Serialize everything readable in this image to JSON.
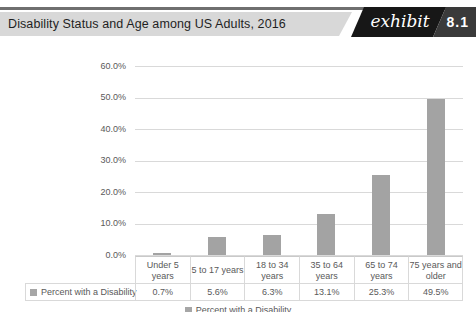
{
  "header": {
    "title": "Disability Status and Age among US Adults, 2016",
    "exhibit_label": "exhibit",
    "exhibit_number": "8.1"
  },
  "chart_data": {
    "type": "bar",
    "title": "Disability Status and Age among US Adults, 2016",
    "categories": [
      "Under 5 years",
      "5 to 17 years",
      "18 to 34 years",
      "35 to 64 years",
      "65 to 74 years",
      "75 years and older"
    ],
    "series": [
      {
        "name": "Percent with a Disability",
        "values": [
          0.7,
          5.6,
          6.3,
          13.1,
          25.3,
          49.5
        ]
      }
    ],
    "value_labels": [
      "0.7%",
      "5.6%",
      "6.3%",
      "13.1%",
      "25.3%",
      "49.5%"
    ],
    "ylim": [
      0,
      60
    ],
    "ytick_step": 10,
    "ytick_labels": [
      "60.0%",
      "50.0%",
      "40.0%",
      "30.0%",
      "20.0%",
      "10.0%",
      "0.0%"
    ],
    "xlabel": "",
    "ylabel": "",
    "grid": true,
    "legend_position": "bottom",
    "legend_label": "Percent with a Disability",
    "bar_color": "#a3a3a3",
    "gridline_color": "#d9d9d9"
  }
}
